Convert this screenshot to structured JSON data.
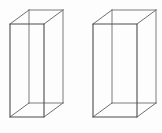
{
  "figure": {
    "background_color": "#fdfdfd",
    "line_color": "#5a5a5a",
    "front_line_color": "#4c4c4c",
    "back_line_color": "#7d7d7d",
    "depth_line_color": "#6e6e6e",
    "projection": "oblique",
    "canvas_width": 162,
    "canvas_height": 133,
    "shape_count": 2,
    "shapes": [
      {
        "name": "left-prism",
        "label": "",
        "front_face": {
          "x": 10,
          "y": 24,
          "width": 34,
          "height": 93
        },
        "depth_dx": 19,
        "depth_dy": -14,
        "front_path": "M10,24 L44,24 L44,117 L10,117 Z",
        "back_path": "M29,10 L63,10 L63,103 L29,103 Z",
        "connector_top_left": "M10,24 L29,10",
        "connector_top_right": "M44,24 L63,10",
        "connector_bottom_left": "M10,117 L29,103",
        "connector_bottom_right": "M44,117 L63,103",
        "visible_back_edges": [
          "M29,10 L63,10",
          "M63,10 L63,103",
          "M29,103 L63,103",
          "M29,10 L29,103"
        ]
      },
      {
        "name": "right-prism",
        "label": "",
        "front_face": {
          "x": 93,
          "y": 24,
          "width": 44,
          "height": 93
        },
        "depth_dx": 19,
        "depth_dy": -14,
        "front_path": "M93,24 L137,24 L137,117 L93,117 Z",
        "back_path": "M112,10 L156,10 L156,103 L112,103 Z",
        "connector_top_left": "M93,24 L112,10",
        "connector_top_right": "M137,24 L156,10",
        "connector_bottom_left": "M93,117 L112,103",
        "connector_bottom_right": "M137,117 L156,103",
        "visible_back_edges": [
          "M112,10 L156,10",
          "M156,10 L156,103",
          "M112,103 L156,103",
          "M112,10 L112,103"
        ]
      }
    ]
  }
}
